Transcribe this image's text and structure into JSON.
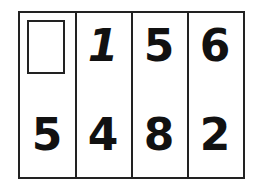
{
  "puzzle": {
    "top_row": [
      "",
      "1",
      "5",
      "6"
    ],
    "bottom_row": [
      "5",
      "4",
      "8",
      "2"
    ],
    "blank_cell": "top_row.0"
  }
}
